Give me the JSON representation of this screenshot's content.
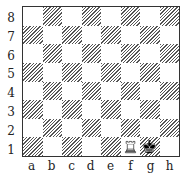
{
  "board": {
    "ranks": [
      "8",
      "7",
      "6",
      "5",
      "4",
      "3",
      "2",
      "1"
    ],
    "files": [
      "a",
      "b",
      "c",
      "d",
      "e",
      "f",
      "g",
      "h"
    ],
    "colors": {
      "dark_hatch": "#555555",
      "light": "#ffffff",
      "border": "#333333"
    },
    "pieces": [
      {
        "square": "f1",
        "piece": "rook",
        "color": "white",
        "icon": "white-rook-icon"
      },
      {
        "square": "g1",
        "piece": "king",
        "color": "black",
        "icon": "black-king-icon"
      }
    ]
  }
}
